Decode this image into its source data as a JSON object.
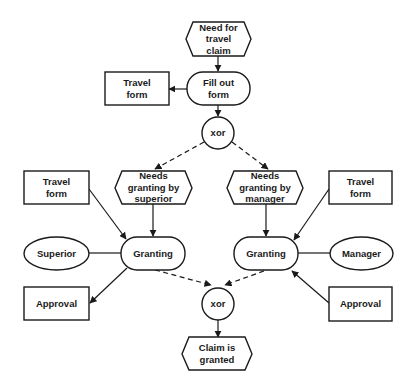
{
  "diagram": {
    "colors": {
      "stroke": "#1a1a1a",
      "fill": "#ffffff",
      "text": "#1a1a1a"
    },
    "nodes": {
      "need_for_travel_claim": {
        "type": "event",
        "lines": [
          "Need for",
          "travel",
          "claim"
        ]
      },
      "fill_out_form": {
        "type": "function",
        "lines": [
          "Fill out",
          "form"
        ]
      },
      "travel_form_top": {
        "type": "document",
        "lines": [
          "Travel",
          "form"
        ]
      },
      "xor_split": {
        "type": "connector",
        "lines": [
          "xor"
        ]
      },
      "needs_granting_superior": {
        "type": "event",
        "lines": [
          "Needs",
          "granting by",
          "superior"
        ]
      },
      "needs_granting_manager": {
        "type": "event",
        "lines": [
          "Needs",
          "granting by",
          "manager"
        ]
      },
      "travel_form_left": {
        "type": "document",
        "lines": [
          "Travel",
          "form"
        ]
      },
      "travel_form_right": {
        "type": "document",
        "lines": [
          "Travel",
          "form"
        ]
      },
      "superior": {
        "type": "organization",
        "lines": [
          "Superior"
        ]
      },
      "granting_left": {
        "type": "function",
        "lines": [
          "Granting"
        ]
      },
      "granting_right": {
        "type": "function",
        "lines": [
          "Granting"
        ]
      },
      "manager": {
        "type": "organization",
        "lines": [
          "Manager"
        ]
      },
      "approval_left": {
        "type": "document",
        "lines": [
          "Approval"
        ]
      },
      "approval_right": {
        "type": "document",
        "lines": [
          "Approval"
        ]
      },
      "xor_join": {
        "type": "connector",
        "lines": [
          "xor"
        ]
      },
      "claim_is_granted": {
        "type": "event",
        "lines": [
          "Claim is",
          "granted"
        ]
      }
    },
    "edges": [
      {
        "from": "need_for_travel_claim",
        "to": "fill_out_form",
        "style": "solid"
      },
      {
        "from": "fill_out_form",
        "to": "travel_form_top",
        "style": "solid"
      },
      {
        "from": "fill_out_form",
        "to": "xor_split",
        "style": "solid"
      },
      {
        "from": "xor_split",
        "to": "needs_granting_superior",
        "style": "dashed"
      },
      {
        "from": "xor_split",
        "to": "needs_granting_manager",
        "style": "dashed"
      },
      {
        "from": "needs_granting_superior",
        "to": "granting_left",
        "style": "solid"
      },
      {
        "from": "needs_granting_manager",
        "to": "granting_right",
        "style": "solid"
      },
      {
        "from": "travel_form_left",
        "to": "granting_left",
        "style": "solid"
      },
      {
        "from": "travel_form_right",
        "to": "granting_right",
        "style": "solid"
      },
      {
        "from": "superior",
        "to": "granting_left",
        "style": "line"
      },
      {
        "from": "manager",
        "to": "granting_right",
        "style": "line"
      },
      {
        "from": "granting_left",
        "to": "approval_left",
        "style": "solid"
      },
      {
        "from": "approval_right",
        "to": "granting_right",
        "style": "solid"
      },
      {
        "from": "granting_left",
        "to": "xor_join",
        "style": "dashed"
      },
      {
        "from": "granting_right",
        "to": "xor_join",
        "style": "dashed"
      },
      {
        "from": "xor_join",
        "to": "claim_is_granted",
        "style": "solid"
      }
    ]
  }
}
